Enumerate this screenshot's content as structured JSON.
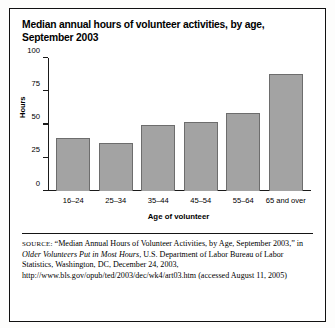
{
  "figure": {
    "title_line1": "Median annual hours of volunteer activities, by age,",
    "title_line2": "September 2003",
    "source_label": "SOURCE:",
    "source_part1": " “Median Annual Hours of Volunteer Activities, by Age, September 2003,” in ",
    "source_italic": "Older Volunteers Put in Most Hours",
    "source_part2": ", U.S. Department of Labor Bureau of Labor Statistics, Washington, DC, December 24, 2003, http://www.bls.gov/opub/ted/2003/dec/wk4/art03.htm (accessed August 11, 2005)"
  },
  "chart_data": {
    "type": "bar",
    "title": "Median annual hours of volunteer activities, by age, September 2003",
    "xlabel": "Age of volunteer",
    "ylabel": "Hours",
    "categories": [
      "16–24",
      "25–34",
      "35–44",
      "45–54",
      "55–64",
      "65 and over"
    ],
    "values": [
      40,
      36,
      50,
      52,
      59,
      88
    ],
    "ylim": [
      0,
      100
    ],
    "yticks": [
      0,
      25,
      50,
      75,
      100
    ],
    "ytick_labels": [
      "0",
      "25",
      "50",
      "75",
      "100"
    ],
    "grid": false,
    "legend": "none",
    "bar_color": "#a3a3a3",
    "bar_edge_color": "#6d6d6d",
    "axis_color": "#1a1a1a"
  }
}
